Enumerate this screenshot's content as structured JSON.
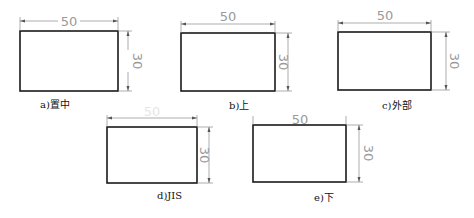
{
  "figures": [
    {
      "id": "a",
      "caption": "a)置中",
      "width_label": "50",
      "height_label": "30",
      "placement": "centered"
    },
    {
      "id": "b",
      "caption": "b)上",
      "width_label": "50",
      "height_label": "30",
      "placement": "above"
    },
    {
      "id": "c",
      "caption": "c)外部",
      "width_label": "50",
      "height_label": "30",
      "placement": "outside"
    },
    {
      "id": "d",
      "caption": "d)JIS",
      "width_label": "50",
      "height_label": "30",
      "placement": "jis"
    },
    {
      "id": "e",
      "caption": "e)下",
      "width_label": "50",
      "height_label": "30",
      "placement": "below"
    }
  ]
}
